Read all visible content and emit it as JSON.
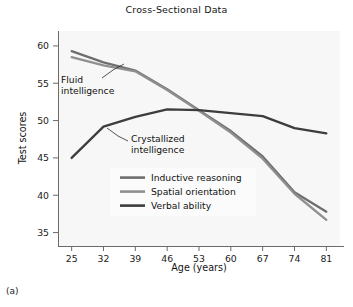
{
  "figure": {
    "title": "Cross-Sectional Data",
    "caption": "(a)"
  },
  "axes": {
    "x_label": "Age (years)",
    "y_label": "Test scores",
    "x_ticks": [
      "25",
      "32",
      "39",
      "46",
      "53",
      "60",
      "67",
      "74",
      "81"
    ],
    "y_ticks": [
      "35",
      "40",
      "45",
      "50",
      "55",
      "60"
    ]
  },
  "annotations": {
    "fluid_line1": "Fluid",
    "fluid_line2": "intelligence",
    "crystallized_line1": "Crystallized",
    "crystallized_line2": "intelligence"
  },
  "legend": {
    "items": [
      {
        "label": "Inductive reasoning",
        "color": "#6e6e6e"
      },
      {
        "label": "Spatial orientation",
        "color": "#8f8f8f"
      },
      {
        "label": "Verbal ability",
        "color": "#3d3d3d"
      }
    ]
  },
  "colors": {
    "plot_background": "#f7f7f7",
    "axis": "#6b6b6b",
    "text": "#141414",
    "legend_background": "#fbfbfb"
  },
  "chart_data": {
    "type": "line",
    "title": "Cross-Sectional Data",
    "xlabel": "Age (years)",
    "ylabel": "Test scores",
    "x": [
      25,
      32,
      39,
      46,
      53,
      60,
      67,
      74,
      81
    ],
    "xlim": [
      22,
      84
    ],
    "ylim": [
      33.2,
      62.0
    ],
    "grid": false,
    "legend_position": "center",
    "series": [
      {
        "name": "Inductive reasoning",
        "color": "#6e6e6e",
        "values": [
          59.3,
          57.8,
          56.7,
          54.2,
          51.4,
          48.6,
          45.2,
          40.4,
          37.8
        ]
      },
      {
        "name": "Spatial orientation",
        "color": "#8f8f8f",
        "values": [
          58.5,
          57.4,
          56.6,
          54.1,
          51.3,
          48.4,
          44.9,
          40.2,
          36.7
        ]
      },
      {
        "name": "Verbal ability",
        "color": "#3d3d3d",
        "values": [
          45.0,
          49.2,
          50.5,
          51.5,
          51.4,
          51.0,
          50.6,
          49.0,
          48.3
        ]
      }
    ],
    "annotations": [
      {
        "text": "Fluid intelligence",
        "points_to_series": [
          "Inductive reasoning",
          "Spatial orientation"
        ]
      },
      {
        "text": "Crystallized intelligence",
        "points_to_series": [
          "Verbal ability"
        ]
      }
    ]
  }
}
